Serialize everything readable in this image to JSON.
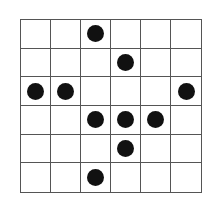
{
  "grid": {
    "rows": 6,
    "cols": 6,
    "dots": [
      [
        0,
        2
      ],
      [
        1,
        3
      ],
      [
        2,
        0
      ],
      [
        2,
        1
      ],
      [
        2,
        5
      ],
      [
        3,
        2
      ],
      [
        3,
        3
      ],
      [
        3,
        4
      ],
      [
        4,
        3
      ],
      [
        5,
        2
      ]
    ],
    "colors": {
      "line": "#555555",
      "dot": "#111111",
      "background": "#ffffff"
    }
  }
}
